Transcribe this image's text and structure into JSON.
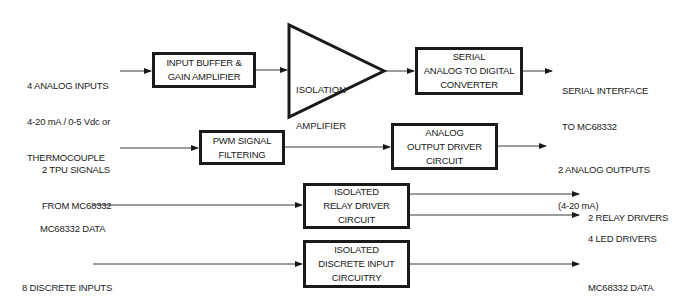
{
  "diagram": {
    "type": "block-diagram",
    "rows": [
      {
        "id": "analog-input-chain",
        "input_label": [
          "4 ANALOG INPUTS",
          "4-20 mA / 0-5 Vdc or",
          "THERMOCOUPLE"
        ],
        "blocks": [
          {
            "id": "input-buffer",
            "lines": [
              "INPUT BUFFER &",
              "GAIN AMPLIFIER"
            ],
            "shape": "box"
          },
          {
            "id": "isolation-amplifier",
            "lines": [
              "ISOLATION",
              "AMPLIFIER"
            ],
            "shape": "triangle"
          },
          {
            "id": "serial-adc",
            "lines": [
              "SERIAL",
              "ANALOG TO DIGITAL",
              "CONVERTER"
            ],
            "shape": "box"
          }
        ],
        "output_label": [
          "SERIAL INTERFACE",
          "TO MC68332"
        ]
      },
      {
        "id": "analog-output-chain",
        "input_label": [
          "2 TPU SIGNALS",
          "FROM MC68332"
        ],
        "blocks": [
          {
            "id": "pwm-filter",
            "lines": [
              "PWM SIGNAL",
              "FILTERING"
            ],
            "shape": "box"
          },
          {
            "id": "analog-output-driver",
            "lines": [
              "ANALOG",
              "OUTPUT DRIVER",
              "CIRCUIT"
            ],
            "shape": "box"
          }
        ],
        "output_label": [
          "2 ANALOG OUTPUTS",
          "(4-20 mA)"
        ]
      },
      {
        "id": "relay-chain",
        "input_label": [
          "MC68332 DATA"
        ],
        "blocks": [
          {
            "id": "relay-driver",
            "lines": [
              "ISOLATED",
              "RELAY DRIVER",
              "CIRCUIT"
            ],
            "shape": "box"
          }
        ],
        "output_labels": [
          "2 RELAY DRIVERS",
          "4 LED DRIVERS"
        ]
      },
      {
        "id": "discrete-input-chain",
        "input_label": [
          "8 DISCRETE INPUTS"
        ],
        "blocks": [
          {
            "id": "discrete-input",
            "lines": [
              "ISOLATED",
              "DISCRETE INPUT",
              "CIRCUITRY"
            ],
            "shape": "box"
          }
        ],
        "output_label": [
          "MC68332 DATA"
        ]
      }
    ]
  },
  "labels": {
    "analog_in_1": "4 ANALOG INPUTS",
    "analog_in_2": "4-20 mA / 0-5 Vdc or",
    "analog_in_3": "THERMOCOUPLE",
    "buffer_1": "INPUT BUFFER &",
    "buffer_2": "GAIN AMPLIFIER",
    "iso_amp_1": "ISOLATION",
    "iso_amp_2": "AMPLIFIER",
    "adc_1": "SERIAL",
    "adc_2": "ANALOG TO DIGITAL",
    "adc_3": "CONVERTER",
    "serial_out_1": "SERIAL INTERFACE",
    "serial_out_2": "TO MC68332",
    "tpu_in_1": "2 TPU SIGNALS",
    "tpu_in_2": "FROM MC68332",
    "pwm_1": "PWM SIGNAL",
    "pwm_2": "FILTERING",
    "aod_1": "ANALOG",
    "aod_2": "OUTPUT DRIVER",
    "aod_3": "CIRCUIT",
    "analog_out_1": "2 ANALOG OUTPUTS",
    "analog_out_2": "(4-20 mA)",
    "data_in": "MC68332 DATA",
    "relay_1": "ISOLATED",
    "relay_2": "RELAY DRIVER",
    "relay_3": "CIRCUIT",
    "relay_out": "2 RELAY DRIVERS",
    "led_out": "4 LED DRIVERS",
    "discrete_in": "8 DISCRETE INPUTS",
    "disc_1": "ISOLATED",
    "disc_2": "DISCRETE INPUT",
    "disc_3": "CIRCUITRY",
    "data_out": "MC68332 DATA"
  },
  "colors": {
    "line": "#1a1a1a",
    "background": "#ffffff"
  }
}
